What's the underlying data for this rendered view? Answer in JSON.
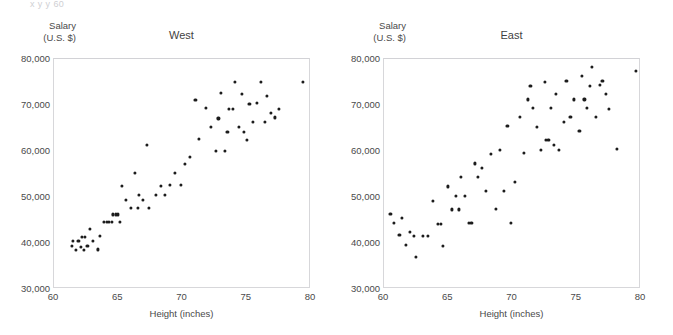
{
  "page": {
    "cut_header_text": "x     y     y              60"
  },
  "chart_data": [
    {
      "type": "scatter",
      "title": "West",
      "xlabel": "Height (inches)",
      "ylabel": "Salary (U.S. $)",
      "ylabel_line1": "Salary",
      "ylabel_line2": "(U.S. $)",
      "xlim": [
        60,
        80
      ],
      "ylim": [
        30000,
        80000
      ],
      "xticks": [
        60,
        65,
        70,
        75,
        80
      ],
      "xticklabels": [
        "60",
        "65",
        "70",
        "75",
        "80"
      ],
      "yticks": [
        30000,
        40000,
        50000,
        60000,
        70000,
        80000
      ],
      "yticklabels": [
        "30,000",
        "40,000",
        "50,000",
        "60,000",
        "70,000",
        "80,000"
      ],
      "grid": false,
      "legend": "none",
      "marker_color": "#1c1c1c",
      "points": [
        [
          61.4,
          39300
        ],
        [
          61.5,
          40400
        ],
        [
          61.7,
          38500
        ],
        [
          61.9,
          40400
        ],
        [
          62.1,
          39200
        ],
        [
          62.2,
          41400
        ],
        [
          62.3,
          38500
        ],
        [
          62.4,
          41400
        ],
        [
          62.6,
          39300
        ],
        [
          62.8,
          43100
        ],
        [
          63.0,
          40400
        ],
        [
          63.4,
          38600
        ],
        [
          63.6,
          41500
        ],
        [
          63.9,
          44500
        ],
        [
          64.1,
          44500
        ],
        [
          64.3,
          44500
        ],
        [
          64.5,
          44600
        ],
        [
          64.6,
          46200
        ],
        [
          64.8,
          46200
        ],
        [
          65.0,
          46200
        ],
        [
          65.1,
          44500
        ],
        [
          65.3,
          52400
        ],
        [
          65.6,
          49300
        ],
        [
          66.0,
          47600
        ],
        [
          66.3,
          55300
        ],
        [
          66.5,
          47600
        ],
        [
          66.6,
          50400
        ],
        [
          66.9,
          49400
        ],
        [
          67.2,
          61400
        ],
        [
          67.4,
          47700
        ],
        [
          67.9,
          50400
        ],
        [
          68.3,
          52500
        ],
        [
          68.6,
          50400
        ],
        [
          69.0,
          52600
        ],
        [
          69.4,
          55300
        ],
        [
          69.9,
          52600
        ],
        [
          70.2,
          57200
        ],
        [
          70.6,
          58700
        ],
        [
          71.0,
          71100
        ],
        [
          71.3,
          62700
        ],
        [
          71.8,
          69300
        ],
        [
          72.2,
          65200
        ],
        [
          72.6,
          60000
        ],
        [
          72.8,
          67100
        ],
        [
          73.0,
          72700
        ],
        [
          73.3,
          60100
        ],
        [
          73.5,
          64200
        ],
        [
          73.6,
          69100
        ],
        [
          73.9,
          69100
        ],
        [
          74.1,
          75000
        ],
        [
          74.4,
          65300
        ],
        [
          74.6,
          72400
        ],
        [
          74.8,
          64200
        ],
        [
          75.0,
          62400
        ],
        [
          75.2,
          70300
        ],
        [
          75.5,
          66300
        ],
        [
          75.8,
          70400
        ],
        [
          76.1,
          75100
        ],
        [
          76.4,
          66400
        ],
        [
          76.6,
          72000
        ],
        [
          76.9,
          68300
        ],
        [
          77.2,
          67300
        ],
        [
          77.5,
          69200
        ],
        [
          79.4,
          75100
        ]
      ]
    },
    {
      "type": "scatter",
      "title": "East",
      "xlabel": "Height (inches)",
      "ylabel": "Salary (U.S. $)",
      "ylabel_line1": "Salary",
      "ylabel_line2": "(U.S. $)",
      "xlim": [
        60,
        80
      ],
      "ylim": [
        30000,
        80000
      ],
      "xticks": [
        60,
        65,
        70,
        75,
        80
      ],
      "xticklabels": [
        "60",
        "65",
        "70",
        "75",
        "80"
      ],
      "yticks": [
        30000,
        40000,
        50000,
        60000,
        70000,
        80000
      ],
      "yticklabels": [
        "30,000",
        "40,000",
        "50,000",
        "60,000",
        "70,000",
        "80,000"
      ],
      "grid": false,
      "legend": "none",
      "marker_color": "#1c1c1c",
      "points": [
        [
          60.5,
          46300
        ],
        [
          60.8,
          44400
        ],
        [
          61.2,
          41700
        ],
        [
          61.4,
          45400
        ],
        [
          61.7,
          39500
        ],
        [
          62.0,
          42500
        ],
        [
          62.3,
          41600
        ],
        [
          62.5,
          37000
        ],
        [
          63.0,
          41600
        ],
        [
          63.4,
          41600
        ],
        [
          63.8,
          49200
        ],
        [
          64.2,
          44200
        ],
        [
          64.4,
          44200
        ],
        [
          64.6,
          39400
        ],
        [
          65.0,
          52300
        ],
        [
          65.3,
          47300
        ],
        [
          65.6,
          50300
        ],
        [
          65.8,
          47300
        ],
        [
          66.0,
          54300
        ],
        [
          66.3,
          50300
        ],
        [
          66.6,
          44400
        ],
        [
          66.8,
          44400
        ],
        [
          67.1,
          57300
        ],
        [
          67.3,
          54300
        ],
        [
          67.6,
          56300
        ],
        [
          67.9,
          51400
        ],
        [
          68.3,
          59300
        ],
        [
          68.7,
          47400
        ],
        [
          69.0,
          60300
        ],
        [
          69.3,
          51400
        ],
        [
          69.6,
          65400
        ],
        [
          69.9,
          44300
        ],
        [
          70.2,
          53300
        ],
        [
          70.6,
          67400
        ],
        [
          70.9,
          59500
        ],
        [
          71.2,
          71200
        ],
        [
          71.4,
          74200
        ],
        [
          71.6,
          69300
        ],
        [
          71.9,
          65300
        ],
        [
          72.2,
          60200
        ],
        [
          72.5,
          75100
        ],
        [
          72.6,
          62400
        ],
        [
          72.8,
          62400
        ],
        [
          73.0,
          69400
        ],
        [
          73.2,
          61400
        ],
        [
          73.4,
          72500
        ],
        [
          73.6,
          60300
        ],
        [
          74.0,
          66300
        ],
        [
          74.2,
          75200
        ],
        [
          74.5,
          67400
        ],
        [
          74.8,
          71200
        ],
        [
          75.2,
          64300
        ],
        [
          75.4,
          76400
        ],
        [
          75.6,
          71200
        ],
        [
          75.8,
          69300
        ],
        [
          76.0,
          74200
        ],
        [
          76.2,
          78200
        ],
        [
          76.5,
          67400
        ],
        [
          76.8,
          74300
        ],
        [
          77.0,
          75200
        ],
        [
          77.3,
          72400
        ],
        [
          77.5,
          69200
        ],
        [
          78.1,
          60400
        ],
        [
          79.6,
          77400
        ]
      ]
    }
  ]
}
